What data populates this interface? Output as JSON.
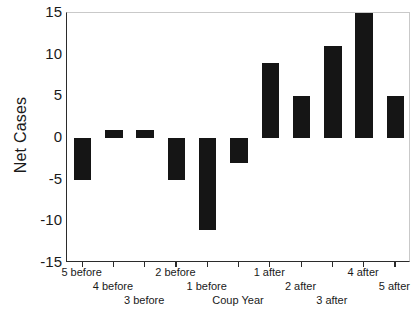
{
  "chart_data": {
    "type": "bar",
    "title": "",
    "subtitle": "",
    "xlabel": "",
    "ylabel": "Net Cases",
    "categories": [
      "5 before",
      "4 before",
      "3 before",
      "2 before",
      "1 before",
      "Coup Year",
      "1 after",
      "2 after",
      "3 after",
      "4 after",
      "5 after"
    ],
    "values": [
      -5,
      1,
      1,
      -5,
      -11,
      -3,
      9,
      5,
      11,
      15,
      5
    ],
    "ylim": [
      -15,
      15
    ],
    "yticks": [
      15,
      10,
      5,
      0,
      -5,
      -10,
      -15
    ],
    "ytick_labels": [
      "15",
      "10",
      "5",
      "0",
      "-5",
      "-10",
      "-15"
    ],
    "grid": false,
    "legend": null,
    "bar_color": "#151515",
    "axis_color": "#2b2b2b",
    "background": "#ffffff",
    "label_stagger_rows": 3,
    "annotations": []
  },
  "axes": {
    "y_title": "Net Cases"
  }
}
